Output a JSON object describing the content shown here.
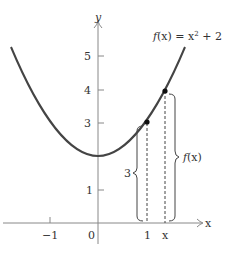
{
  "figure": {
    "function_label": "f(x) = x² + 2",
    "function_label_f": "f",
    "function_label_rest": "(x) = x",
    "function_label_exp": "2",
    "function_label_tail": " + 2",
    "axis": {
      "x_label": "x",
      "y_label": "y",
      "x_ticks": [
        {
          "label": "−1",
          "value": -1
        },
        {
          "label": "0",
          "value": 0
        },
        {
          "label": "1",
          "value": 1
        },
        {
          "label": "x",
          "value": 1.38
        }
      ],
      "y_ticks": [
        {
          "label": "1",
          "value": 1
        },
        {
          "label": "3",
          "value": 3
        },
        {
          "label": "4",
          "value": 4
        },
        {
          "label": "5",
          "value": 5
        }
      ]
    },
    "points": [
      {
        "name": "point-1-3",
        "x": 1,
        "y": 3
      },
      {
        "name": "point-x-fx",
        "x": 1.38,
        "y": 3.9
      }
    ],
    "braces": {
      "left_label": "3",
      "right_label_f": "f",
      "right_label_rest": "(x)"
    },
    "colors": {
      "curve": "#444444",
      "axis": "#777777",
      "text": "#333333"
    }
  }
}
